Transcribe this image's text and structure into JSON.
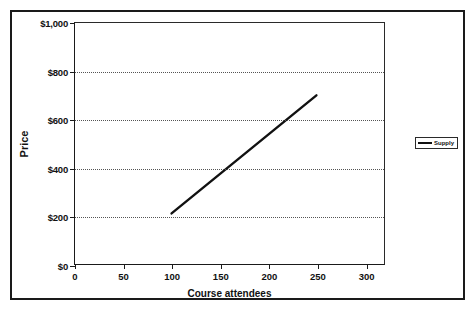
{
  "chart_data": {
    "type": "line",
    "title": "",
    "xlabel": "Course attendees",
    "ylabel": "Price",
    "xlim": [
      0,
      320
    ],
    "ylim": [
      0,
      1000
    ],
    "grid": "horizontal-dotted",
    "legend_position": "right",
    "x_ticks": [
      {
        "value": 0,
        "label": "0"
      },
      {
        "value": 50,
        "label": "50"
      },
      {
        "value": 100,
        "label": "100"
      },
      {
        "value": 150,
        "label": "150"
      },
      {
        "value": 200,
        "label": "200"
      },
      {
        "value": 250,
        "label": "250"
      },
      {
        "value": 300,
        "label": "300"
      }
    ],
    "y_ticks": [
      {
        "value": 0,
        "label": "$0"
      },
      {
        "value": 200,
        "label": "$200"
      },
      {
        "value": 400,
        "label": "$400"
      },
      {
        "value": 600,
        "label": "$600"
      },
      {
        "value": 800,
        "label": "$800"
      },
      {
        "value": 1000,
        "label": "$1,000"
      }
    ],
    "gridline_values": [
      200,
      400,
      600,
      800
    ],
    "series": [
      {
        "name": "Supply",
        "color": "#111111",
        "x": [
          100,
          250
        ],
        "values": [
          210,
          700
        ],
        "points": [
          {
            "x": 100,
            "y": 210
          },
          {
            "x": 250,
            "y": 700
          }
        ]
      }
    ]
  },
  "legend": {
    "entries": [
      {
        "label": "Supply",
        "color": "#111111",
        "marker": "line-swatch"
      }
    ]
  },
  "axis_titles": {
    "x": "Course attendees",
    "y": "Price"
  },
  "colors": {
    "frame": "#1a1a1a",
    "axis": "#1a1a1a",
    "grid": "#555555",
    "series": "#111111",
    "background": "#ffffff"
  }
}
